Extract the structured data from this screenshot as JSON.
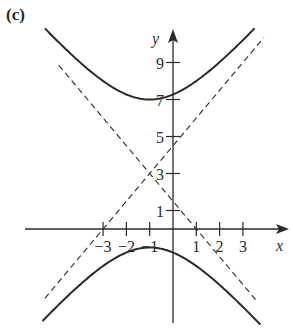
{
  "figure": {
    "panel_label": "(c)"
  },
  "chart_data": {
    "type": "line",
    "title": "",
    "panel_label": "(c)",
    "xlabel": "x",
    "ylabel": "y",
    "x_ticks": [
      -3,
      -2,
      -1,
      1,
      2,
      3
    ],
    "x_tick_labels": [
      "−3",
      "−2",
      "−1",
      "1",
      "2",
      "3"
    ],
    "y_ticks": [
      1,
      3,
      5,
      7,
      9
    ],
    "y_tick_labels": [
      "1",
      "3",
      "5",
      "7",
      "9"
    ],
    "xlim": [
      -6.5,
      5
    ],
    "ylim": [
      -5,
      10.8
    ],
    "grid": false,
    "legend": null,
    "curve": {
      "kind": "hyperbola",
      "equation": "(y-3)^2/16 - (x+1)^2/(64/9) = 1",
      "center": [
        -1,
        3
      ],
      "vertices": [
        [
          -1,
          7
        ],
        [
          -1,
          -1
        ]
      ],
      "style": "solid"
    },
    "asymptotes": [
      {
        "equation": "y = 1.5x + 4.5",
        "slope": 1.5,
        "intercept": 4.5,
        "style": "dashed"
      },
      {
        "equation": "y = -1.5x + 1.5",
        "slope": -1.5,
        "intercept": 1.5,
        "style": "dashed"
      }
    ],
    "series": [
      {
        "name": "upper branch",
        "x": [
          -6.5,
          -5,
          -3,
          -1,
          1,
          3,
          5
        ],
        "y": [
          10.95,
          9.2,
          7.97,
          7.0,
          7.97,
          9.2,
          10.95
        ]
      },
      {
        "name": "lower branch",
        "x": [
          -6.5,
          -5,
          -3,
          -1,
          1,
          3,
          5
        ],
        "y": [
          -4.95,
          -3.2,
          -1.97,
          -1.0,
          -1.97,
          -3.2,
          -4.95
        ]
      }
    ]
  },
  "colors": {
    "ink": "#2a2a2a",
    "background": "#ffffff"
  }
}
